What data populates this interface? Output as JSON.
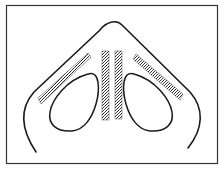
{
  "figure": {
    "width": 221,
    "height": 169,
    "background": "#ffffff",
    "stroke_color": "#1a1a1a",
    "stipple_color": "#3a3a3a",
    "elements": [
      "frame",
      "outer-arch",
      "left-loop",
      "right-loop",
      "left-diagonal-band",
      "right-diagonal-band",
      "center-left-vertical-band",
      "center-right-vertical-band"
    ]
  }
}
